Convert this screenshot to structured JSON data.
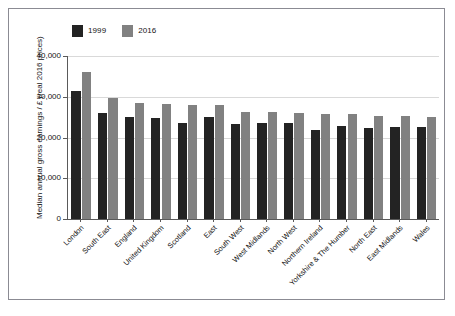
{
  "figure": {
    "border_color": "#8b8b93",
    "background": "#ffffff"
  },
  "chart_data": {
    "type": "bar",
    "title": "",
    "xlabel": "",
    "ylabel": "Median annual gross earnings / £ (real 2016 prices)",
    "ylim": [
      0,
      40000
    ],
    "ytick_labels": [
      "40,000",
      "30,000",
      "20,000",
      "10,000",
      "0"
    ],
    "ytick_values": [
      40000,
      30000,
      20000,
      10000,
      0
    ],
    "grid": true,
    "legend_position": "top-left",
    "categories": [
      "London",
      "South East",
      "England",
      "United Kingdom",
      "Scotland",
      "East",
      "South West",
      "West Midlands",
      "North West",
      "Northern Ireland",
      "Yorkshire & The Humber",
      "North East",
      "East Midlands",
      "Wales"
    ],
    "series": [
      {
        "name": "1999",
        "color": "#232323",
        "values": [
          31400,
          26100,
          25000,
          24800,
          23500,
          25000,
          23200,
          23600,
          23500,
          21900,
          22800,
          22400,
          22500,
          22600
        ]
      },
      {
        "name": "2016",
        "color": "#818181",
        "values": [
          36100,
          29700,
          28500,
          28200,
          27900,
          27900,
          26200,
          26200,
          26000,
          25800,
          25700,
          25300,
          25200,
          25100
        ]
      }
    ]
  },
  "legend": {
    "entries": [
      {
        "label": "1999",
        "color": "#232323"
      },
      {
        "label": "2016",
        "color": "#818181"
      }
    ]
  }
}
